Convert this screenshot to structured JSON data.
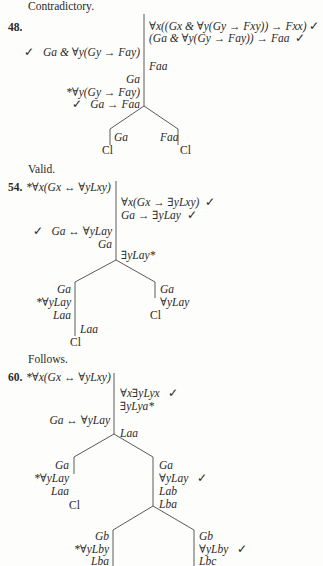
{
  "results": {
    "prev": "Contradictory.",
    "p48": "Valid.",
    "p54": "Follows."
  },
  "problem48": {
    "number": "48.",
    "right": [
      "∀x((Gx & ∀y(Gy → Fxy)) → Fxx)",
      "(Ga & ∀y(Gy → Fay)) → Faa"
    ],
    "left1": "Ga & ∀y(Gy → Fay)",
    "faa": "Faa",
    "left2": [
      "Ga",
      "*∀y(Gy → Fay)",
      "Ga → Faa"
    ],
    "branch_left": "Ga",
    "branch_right": "Faa",
    "closed": "Cl",
    "check": "✓"
  },
  "problem54": {
    "number": "54.",
    "premise": "*∀x(Gx ↔ ∀yLxy)",
    "right": [
      "∀x(Gx → ∃yLxy)",
      "Ga → ∃yLay"
    ],
    "left": [
      "Ga ↔ ∀yLay",
      "Ga"
    ],
    "exists": "∃yLay*",
    "branch_left": [
      "Ga",
      "*∀yLay",
      "Laa"
    ],
    "branch_left_sub": "Laa",
    "branch_right": [
      "Ga",
      "∀yLay"
    ],
    "closed": "Cl",
    "check": "✓"
  },
  "problem60": {
    "number": "60.",
    "premise": "*∀x(Gx ↔ ∀yLxy)",
    "right": [
      "∀x∃yLyx",
      "∃yLya*"
    ],
    "left": "Ga ↔ ∀yLay",
    "laa": "Laa",
    "branch_left": [
      "Ga",
      "*∀yLay",
      "Laa"
    ],
    "branch_right": [
      "Ga",
      "∀yLay",
      "Lab",
      "Lba"
    ],
    "sub_left": [
      "Gb",
      "*∀yLby",
      "Lba"
    ],
    "sub_right": [
      "Gb",
      "∀yLby",
      "Lbc"
    ],
    "closed": "Cl",
    "check": "✓"
  }
}
